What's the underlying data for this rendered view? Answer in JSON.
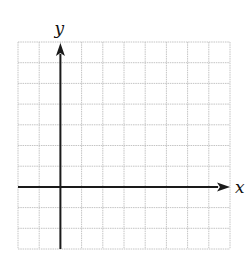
{
  "chart_data": {
    "type": "coordinate_grid",
    "title": "",
    "xlabel": "x",
    "ylabel": "y",
    "grid": true,
    "columns": 10,
    "rows": 10,
    "x_range": [
      -2,
      8
    ],
    "y_range": [
      -3,
      7
    ],
    "origin_cell": {
      "col": 2,
      "row": 7
    },
    "data": []
  },
  "layout": {
    "grid_left": 18,
    "grid_top": 42,
    "grid_right": 230,
    "grid_bottom": 249,
    "grid_color": "#c4c4c4",
    "axis_color": "#1a1a1a"
  }
}
